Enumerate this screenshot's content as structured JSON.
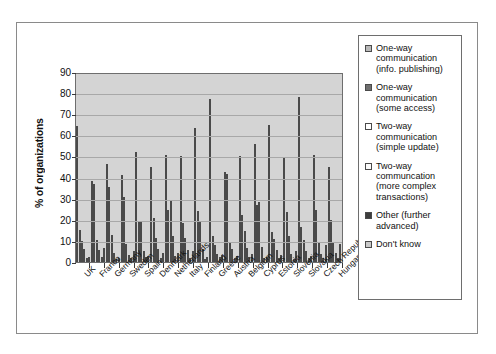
{
  "chart_data": {
    "type": "bar",
    "title": "",
    "xlabel": "",
    "ylabel": "% of organizations",
    "ylim": [
      0,
      90
    ],
    "yticks": [
      0,
      10,
      20,
      30,
      40,
      50,
      60,
      70,
      80,
      90
    ],
    "grid": true,
    "legend_position": "right",
    "categories": [
      "UK",
      "France",
      "Germany",
      "Sweden",
      "Spain",
      "Denmark",
      "Netherlands",
      "Italy",
      "Finland",
      "Greece",
      "Austria",
      "Belgium",
      "Cyprus",
      "Estonia",
      "Slovenia",
      "Slovakia",
      "Czech Republic",
      "Hungary"
    ],
    "series": [
      {
        "name": "One-way communication (info. publishing)",
        "color": "#b9b9b9",
        "values": [
          64.5,
          38.2,
          46.2,
          41.0,
          52.2,
          44.9,
          50.5,
          50.0,
          63.6,
          77.2,
          42.5,
          50.2,
          56.0,
          65.0,
          49.5,
          78.0,
          50.5,
          45.0
        ]
      },
      {
        "name": "One-way communication (some access)",
        "color": "#6f6f6f",
        "values": [
          15.2,
          36.8,
          35.3,
          31.0,
          19.5,
          21.0,
          24.5,
          18.5,
          24.2,
          12.5,
          41.5,
          22.5,
          26.8,
          14.0,
          23.5,
          16.5,
          24.5,
          20.0
        ]
      },
      {
        "name": "Two-way communication (simple update)",
        "color": "#ffffff",
        "values": [
          9.8,
          10.5,
          12.8,
          8.5,
          19.2,
          11.2,
          29.5,
          11.5,
          19.0,
          8.0,
          9.5,
          14.5,
          28.2,
          11.0,
          12.5,
          10.5,
          9.5,
          9.0
        ]
      },
      {
        "name": "Two-way communcation (more complex transactions)",
        "color": "#fbfbfb",
        "values": [
          6.0,
          5.5,
          4.5,
          3.5,
          5.0,
          6.2,
          12.5,
          5.5,
          6.2,
          4.0,
          6.0,
          6.5,
          7.0,
          5.5,
          4.0,
          5.0,
          4.0,
          4.5
        ]
      },
      {
        "name": "Other (further advanced)",
        "color": "#3d3d3d",
        "values": [
          2.0,
          2.2,
          1.5,
          2.0,
          2.5,
          2.0,
          3.0,
          2.0,
          1.5,
          2.5,
          2.0,
          2.5,
          2.0,
          2.0,
          1.5,
          2.0,
          2.0,
          2.0
        ]
      },
      {
        "name": "Don't know",
        "color": "#c9c9c9",
        "values": [
          2.5,
          6.5,
          2.0,
          5.0,
          3.0,
          4.5,
          4.5,
          5.0,
          2.5,
          3.5,
          3.0,
          4.0,
          2.5,
          3.5,
          5.0,
          3.0,
          8.0,
          8.5
        ]
      }
    ]
  },
  "legend": {
    "items": [
      {
        "label": "One-way communication (info. publishing)",
        "swatch": "#b9b9b9"
      },
      {
        "label": "One-way communication (some access)",
        "swatch": "#6f6f6f"
      },
      {
        "label": "Two-way communication (simple update)",
        "swatch": "#ffffff"
      },
      {
        "label": "Two-way communcation (more complex transactions)",
        "swatch": "#fbfbfb"
      },
      {
        "label": "Other (further advanced)",
        "swatch": "#3d3d3d"
      },
      {
        "label": "Don't know",
        "swatch": "#c9c9c9"
      }
    ]
  }
}
